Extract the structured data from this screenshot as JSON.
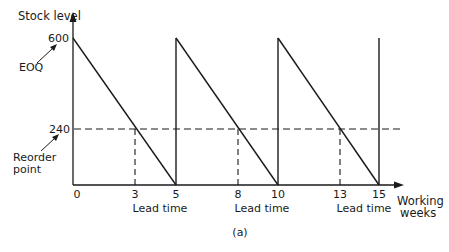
{
  "figure": {
    "y_axis_label": "Stock level",
    "x_axis_label_line1": "Working",
    "x_axis_label_line2": "weeks",
    "eoq_label": "EOQ",
    "reorder_label_line1": "Reorder",
    "reorder_label_line2": "point",
    "y_tick_600": "600",
    "y_tick_240": "240",
    "x_ticks": [
      "0",
      "3",
      "5",
      "8",
      "10",
      "13",
      "15"
    ],
    "lead_time_label": "Lead time",
    "caption": "(a)"
  },
  "diagram": {
    "type": "sawtooth inventory diagram",
    "max_stock": 600,
    "reorder_level": 240,
    "cycle_weeks": 5,
    "lead_time_weeks": 2,
    "cycles": [
      {
        "start_week": 0,
        "reorder_week": 3,
        "end_week": 5
      },
      {
        "start_week": 5,
        "reorder_week": 8,
        "end_week": 10
      },
      {
        "start_week": 10,
        "reorder_week": 13,
        "end_week": 15
      }
    ],
    "line_color": "#1a1a1a"
  }
}
